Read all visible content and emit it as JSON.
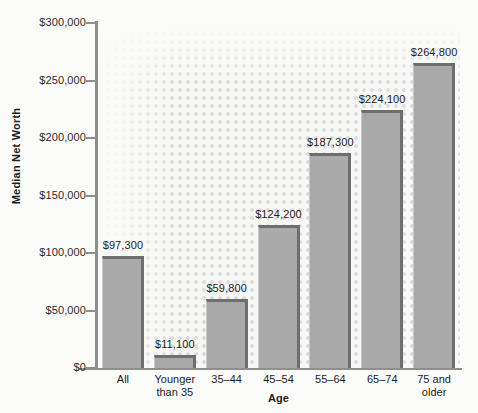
{
  "chart_data": {
    "type": "bar",
    "title": "",
    "subtitle": "",
    "xlabel": "Age",
    "ylabel": "Median Net Worth",
    "categories": [
      "All",
      "Younger\nthan 35",
      "35–44",
      "45–54",
      "55–64",
      "65–74",
      "75 and\nolder"
    ],
    "values": [
      97300,
      11100,
      59800,
      124200,
      187300,
      224100,
      264800
    ],
    "data_labels": [
      "$97,300",
      "$11,100",
      "$59,800",
      "$124,200",
      "$187,300",
      "$224,100",
      "$264,800"
    ],
    "ylim": [
      0,
      300000
    ],
    "ytick_values": [
      0,
      50000,
      100000,
      150000,
      200000,
      250000,
      300000
    ],
    "ytick_labels": [
      "$0",
      "$50,000",
      "$100,000",
      "$150,000",
      "$200,000",
      "$250,000",
      "$300,000"
    ],
    "grid": false,
    "legend": null,
    "bar_color": "#a9a9a9",
    "bar_edge_color": "#6e6e6e",
    "plot_background": "#f7f7f6",
    "figure_background": "#fbfbfa",
    "axis_color": "#8e8e8e",
    "text_color": "#1d1d1d"
  }
}
